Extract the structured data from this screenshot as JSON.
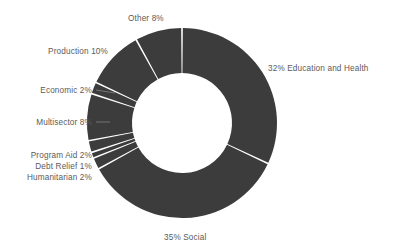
{
  "chart_data": {
    "type": "pie",
    "variant": "donut",
    "title": "",
    "subtitle": "",
    "xlabel": "",
    "ylabel": "",
    "legend_position": "none",
    "grid": false,
    "start_angle_deg": 0,
    "direction": "clockwise",
    "units": "percent",
    "total": 100,
    "colors": {
      "slice_fill": "#3c3c3c",
      "slice_gap": "#ffffff",
      "background": "#ffffff",
      "label_text": "#5a5a5a"
    },
    "categories": [
      "Education and Health",
      "Social",
      "Humanitarian",
      "Debt Relief",
      "Program Aid",
      "Multisector",
      "Economic",
      "Production",
      "Other"
    ],
    "values": [
      32,
      35,
      2,
      1,
      2,
      8,
      2,
      10,
      8
    ],
    "slices": [
      {
        "name": "Education and Health",
        "value": 32,
        "label": "32% Education and Health"
      },
      {
        "name": "Social",
        "value": 35,
        "label": "35% Social"
      },
      {
        "name": "Humanitarian",
        "value": 2,
        "label": "Humanitarian 2%"
      },
      {
        "name": "Debt Relief",
        "value": 1,
        "label": "Debt Relief 1%"
      },
      {
        "name": "Program Aid",
        "value": 2,
        "label": "Program Aid 2%"
      },
      {
        "name": "Multisector",
        "value": 8,
        "label": "Multisector 8%"
      },
      {
        "name": "Economic",
        "value": 2,
        "label": "Economic 2%"
      },
      {
        "name": "Production",
        "value": 10,
        "label": "Production 10%"
      },
      {
        "name": "Other",
        "value": 8,
        "label": "Other 8%"
      }
    ]
  },
  "labels": {
    "education_health": "32% Education and Health",
    "social": "35% Social",
    "other": "Other 8%",
    "production": "Production 10%",
    "economic": "Economic 2%",
    "multisector": "Multisector 8%",
    "program_aid": "Program Aid 2%",
    "debt_relief": "Debt Relief 1%",
    "humanitarian": "Humanitarian 2%"
  }
}
